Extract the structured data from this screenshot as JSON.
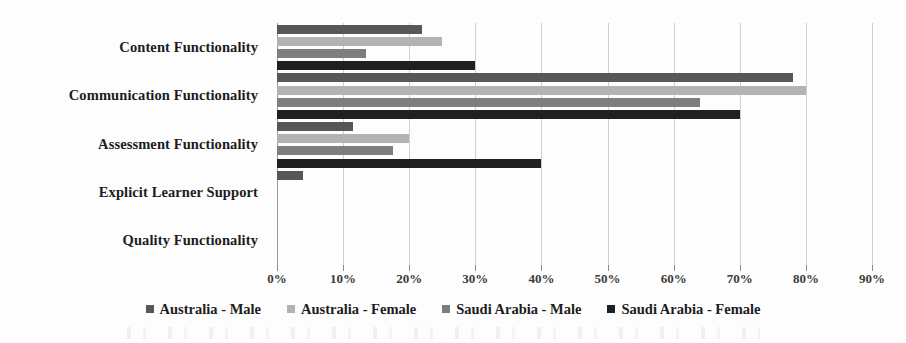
{
  "chart_data": {
    "type": "bar",
    "orientation": "horizontal",
    "title": "",
    "xlabel": "",
    "ylabel": "",
    "xlim": [
      0,
      90
    ],
    "xtick_labels": [
      "0%",
      "10%",
      "20%",
      "30%",
      "40%",
      "50%",
      "60%",
      "70%",
      "80%",
      "90%"
    ],
    "xticks": [
      0,
      10,
      20,
      30,
      40,
      50,
      60,
      70,
      80,
      90
    ],
    "grid": true,
    "legend_position": "bottom",
    "categories": [
      "Content Functionality",
      "Communication Functionality",
      "Assessment Functionality",
      "Explicit Learner Support",
      "Quality Functionality"
    ],
    "series": [
      {
        "name": "Australia - Male",
        "color": "#575757",
        "values": [
          22,
          78,
          11.5,
          4,
          0
        ]
      },
      {
        "name": "Australia - Female",
        "color": "#b3b3b3",
        "values": [
          25,
          80,
          20,
          0,
          0
        ]
      },
      {
        "name": "Saudi Arabia - Male",
        "color": "#7e7e7e",
        "values": [
          13.5,
          64,
          17.5,
          0,
          0
        ]
      },
      {
        "name": "Saudi Arabia - Female",
        "color": "#202020",
        "values": [
          30,
          70,
          40,
          0,
          0
        ]
      }
    ]
  }
}
